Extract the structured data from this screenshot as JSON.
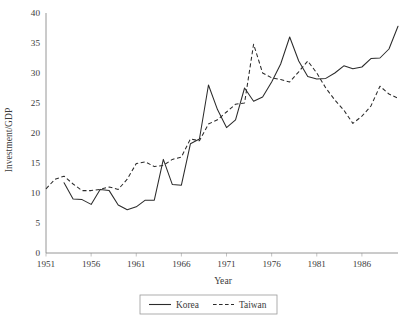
{
  "chart_data": {
    "type": "line",
    "title": "",
    "xlabel": "Year",
    "ylabel": "Investment/GDP",
    "xlim": [
      1951,
      1990
    ],
    "ylim": [
      0,
      40
    ],
    "ytick_values": [
      0,
      5,
      10,
      15,
      20,
      25,
      30,
      35,
      40
    ],
    "ytick_labels": [
      "0",
      "5",
      "10",
      "15",
      "20",
      "25",
      "30",
      "35",
      "40"
    ],
    "xtick_values": [
      1951,
      1956,
      1961,
      1966,
      1971,
      1976,
      1981,
      1986
    ],
    "xtick_labels": [
      "1951",
      "1956",
      "1961",
      "1966",
      "1971",
      "1976",
      "1981",
      "1986"
    ],
    "grid": false,
    "legend_position": "bottom-center",
    "series": [
      {
        "name": "Korea",
        "style": "solid",
        "color": "#2b2b2b",
        "x": [
          1953,
          1954,
          1955,
          1956,
          1957,
          1958,
          1959,
          1960,
          1961,
          1962,
          1963,
          1964,
          1965,
          1966,
          1967,
          1968,
          1969,
          1970,
          1971,
          1972,
          1973,
          1974,
          1975,
          1976,
          1977,
          1978,
          1979,
          1980,
          1981,
          1982,
          1983,
          1984,
          1985,
          1986,
          1987,
          1988,
          1989,
          1990
        ],
        "values": [
          11.7,
          9.0,
          8.9,
          8.1,
          10.6,
          10.4,
          8.0,
          7.2,
          7.7,
          8.8,
          8.8,
          15.6,
          11.4,
          11.3,
          18.2,
          19.0,
          28.0,
          23.9,
          20.9,
          22.2,
          27.5,
          25.3,
          26.0,
          28.5,
          31.5,
          36.0,
          32.0,
          29.4,
          29.0,
          29.1,
          30.0,
          31.2,
          30.7,
          31.0,
          32.4,
          32.5,
          34.0,
          37.8
        ]
      },
      {
        "name": "Taiwan",
        "style": "dashed",
        "color": "#2b2b2b",
        "x": [
          1951,
          1952,
          1953,
          1954,
          1955,
          1956,
          1957,
          1958,
          1959,
          1960,
          1961,
          1962,
          1963,
          1964,
          1965,
          1966,
          1967,
          1968,
          1969,
          1970,
          1971,
          1972,
          1973,
          1974,
          1975,
          1976,
          1977,
          1978,
          1979,
          1980,
          1981,
          1982,
          1983,
          1984,
          1985,
          1986,
          1987,
          1988,
          1989,
          1990
        ],
        "values": [
          10.7,
          12.3,
          12.8,
          11.5,
          10.4,
          10.4,
          10.6,
          11.0,
          10.6,
          12.3,
          14.9,
          15.2,
          14.4,
          14.6,
          15.6,
          16.0,
          19.0,
          18.7,
          21.5,
          22.2,
          23.5,
          24.8,
          25.0,
          34.8,
          30.0,
          29.2,
          28.9,
          28.5,
          30.2,
          32.0,
          30.0,
          27.5,
          25.5,
          23.8,
          21.6,
          22.8,
          24.5,
          27.8,
          26.5,
          25.8
        ]
      }
    ]
  },
  "legend": {
    "items": [
      {
        "label": "Korea",
        "style": "solid"
      },
      {
        "label": "Taiwan",
        "style": "dashed"
      }
    ]
  },
  "caption": {
    "text": ""
  }
}
